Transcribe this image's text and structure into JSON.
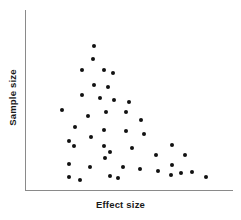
{
  "chart_data": {
    "type": "scatter",
    "title": "",
    "xlabel": "Effect size",
    "ylabel": "Sample size",
    "grid": false,
    "legend": null,
    "xlim": [
      0,
      100
    ],
    "ylim": [
      0,
      100
    ],
    "axis_ticks": {
      "x": [],
      "y": []
    },
    "marker": {
      "shape": "circle",
      "color": "#111111",
      "size": 4
    },
    "axis_color": "#8a8a8a",
    "n_points": 44,
    "points": [
      {
        "x": 33.3,
        "y": 80.0
      },
      {
        "x": 32.9,
        "y": 72.8
      },
      {
        "x": 27.5,
        "y": 66.7
      },
      {
        "x": 38.2,
        "y": 66.7
      },
      {
        "x": 42.5,
        "y": 65.0
      },
      {
        "x": 33.3,
        "y": 58.3
      },
      {
        "x": 40.1,
        "y": 57.2
      },
      {
        "x": 27.5,
        "y": 52.8
      },
      {
        "x": 36.2,
        "y": 51.1
      },
      {
        "x": 43.0,
        "y": 50.0
      },
      {
        "x": 50.2,
        "y": 48.9
      },
      {
        "x": 17.9,
        "y": 44.4
      },
      {
        "x": 39.1,
        "y": 43.3
      },
      {
        "x": 48.8,
        "y": 43.3
      },
      {
        "x": 30.4,
        "y": 41.1
      },
      {
        "x": 56.0,
        "y": 38.9
      },
      {
        "x": 24.2,
        "y": 35.0
      },
      {
        "x": 38.2,
        "y": 33.3
      },
      {
        "x": 48.8,
        "y": 32.8
      },
      {
        "x": 57.5,
        "y": 31.1
      },
      {
        "x": 31.9,
        "y": 29.4
      },
      {
        "x": 21.3,
        "y": 27.2
      },
      {
        "x": 23.7,
        "y": 24.4
      },
      {
        "x": 38.2,
        "y": 24.4
      },
      {
        "x": 51.7,
        "y": 23.3
      },
      {
        "x": 71.0,
        "y": 25.0
      },
      {
        "x": 63.3,
        "y": 19.4
      },
      {
        "x": 38.7,
        "y": 17.8
      },
      {
        "x": 41.1,
        "y": 21.1
      },
      {
        "x": 71.0,
        "y": 13.9
      },
      {
        "x": 77.3,
        "y": 19.4
      },
      {
        "x": 21.3,
        "y": 14.4
      },
      {
        "x": 31.4,
        "y": 12.8
      },
      {
        "x": 47.3,
        "y": 12.8
      },
      {
        "x": 55.6,
        "y": 11.7
      },
      {
        "x": 64.3,
        "y": 10.6
      },
      {
        "x": 70.5,
        "y": 8.3
      },
      {
        "x": 75.4,
        "y": 9.4
      },
      {
        "x": 80.7,
        "y": 10.0
      },
      {
        "x": 21.3,
        "y": 7.2
      },
      {
        "x": 41.1,
        "y": 7.8
      },
      {
        "x": 44.9,
        "y": 6.7
      },
      {
        "x": 87.4,
        "y": 7.2
      },
      {
        "x": 26.6,
        "y": 5.6
      }
    ]
  }
}
